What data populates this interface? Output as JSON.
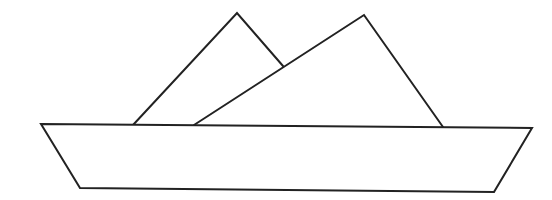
{
  "figure": {
    "stroke_color": "#222222",
    "background": "#ffffff",
    "hull": {
      "points": [
        [
          41,
          124
        ],
        [
          532,
          128
        ],
        [
          494,
          192
        ],
        [
          80,
          188
        ]
      ]
    },
    "sail_left": {
      "points": [
        [
          133,
          125
        ],
        [
          237,
          13
        ],
        [
          283,
          66
        ]
      ]
    },
    "sail_right": {
      "points": [
        [
          194,
          125
        ],
        [
          364,
          15
        ],
        [
          443,
          127
        ]
      ]
    }
  }
}
